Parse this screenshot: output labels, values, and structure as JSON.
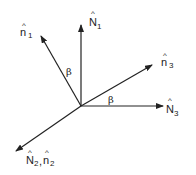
{
  "diagram": {
    "title": "",
    "colors": {
      "stroke": "#222222",
      "background": "#ffffff"
    },
    "origin": {
      "x": 81,
      "y": 106
    },
    "vectors": [
      {
        "id": "N1",
        "label": "N",
        "subscript": "1",
        "hat": "^",
        "tip": {
          "x": 81,
          "y": 24
        }
      },
      {
        "id": "n1",
        "label": "n",
        "subscript": "1",
        "hat": "^",
        "tip": {
          "x": 40,
          "y": 35
        }
      },
      {
        "id": "n3",
        "label": "n",
        "subscript": "3",
        "hat": "^",
        "tip": {
          "x": 153,
          "y": 64
        }
      },
      {
        "id": "N3",
        "label": "N",
        "subscript": "3",
        "hat": "^",
        "tip": {
          "x": 164,
          "y": 106
        }
      },
      {
        "id": "N2n2",
        "label": "N",
        "subscript": "2",
        "label2": "n",
        "subscript2": "2",
        "separator": ",",
        "hat": "^",
        "tip": {
          "x": 15,
          "y": 152
        }
      }
    ],
    "angles": [
      {
        "symbol": "β",
        "between": [
          "N1",
          "n1"
        ]
      },
      {
        "symbol": "β",
        "between": [
          "N3",
          "n3"
        ]
      }
    ]
  }
}
